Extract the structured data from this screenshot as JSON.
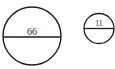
{
  "diagram": {
    "circles": [
      {
        "id": "large",
        "label": "66",
        "cx": 32,
        "cy": 36,
        "r": 29
      },
      {
        "id": "small",
        "label": "11",
        "cx": 99,
        "cy": 28.5,
        "r": 15
      }
    ],
    "colors": {
      "stroke": "#1e1e1e",
      "text": "#2a2a2a",
      "background": "#ffffff"
    }
  }
}
